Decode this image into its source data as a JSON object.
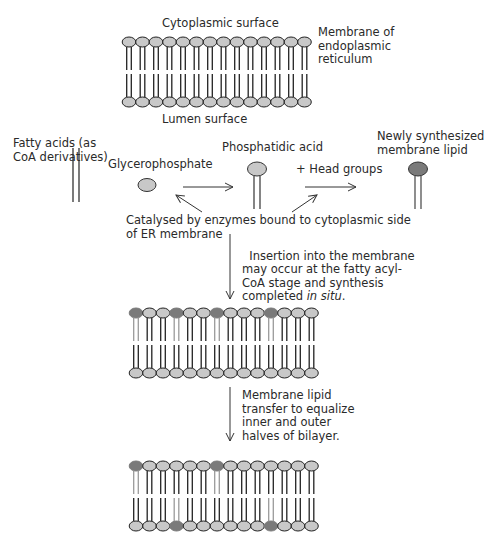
{
  "labels": {
    "cytoplasmic_surface": "Cytoplasmic surface",
    "membrane_er": "Membrane of\nendoplasmic\nreticulum",
    "lumen_surface": "Lumen surface",
    "fatty_acids": "Fatty acids (as\nCoA derivatives)",
    "glycerophosphate": "Glycerophosphate",
    "phosphatidic_acid": "Phosphatidic acid",
    "head_groups": "+ Head groups",
    "newly_synthesized": "Newly synthesized\nmembrane lipid",
    "catalysed": "Catalysed by enzymes bound to cytoplasmic side\nof ER membrane",
    "insertion_1": "Insertion into the membrane\nmay occur at the fatty acyl-\nCoA stage and synthesis",
    "insertion_2_prefix": "completed ",
    "insertion_2_italic": "in situ",
    "insertion_2_suffix": ".",
    "transfer": "Membrane lipid\ntransfer to equalize\ninner and outer\nhalves of bilayer."
  },
  "colors": {
    "head_light": "#c8c8c8",
    "head_dark": "#7a7a7a",
    "tail_light": "#9a9a9a",
    "outline": "#222222"
  },
  "membranes": [
    {
      "name": "er-membrane-initial",
      "x0": 129,
      "y_top": 42,
      "y_bot": 102,
      "count": 14,
      "new_top": [],
      "new_bot": []
    },
    {
      "name": "er-membrane-after-insertion",
      "x0": 136,
      "y_top": 313,
      "y_bot": 373,
      "count": 14,
      "new_top": [
        0,
        3,
        6,
        10
      ],
      "new_bot": []
    },
    {
      "name": "er-membrane-after-transfer",
      "x0": 136,
      "y_top": 466,
      "y_bot": 526,
      "count": 14,
      "new_top": [
        0,
        6
      ],
      "new_bot": [
        3,
        10
      ]
    }
  ]
}
